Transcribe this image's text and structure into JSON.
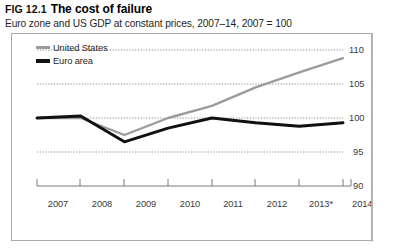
{
  "figure": {
    "number": "FIG 12.1",
    "title": "The cost of failure",
    "subtitle": "Euro zone and US GDP at constant prices, 2007–14, 2007 = 100"
  },
  "legend": {
    "position": "top-left",
    "items": [
      {
        "label": "United States",
        "color": "#9b9b9b",
        "swatch": "us"
      },
      {
        "label": "Euro area",
        "color": "#111111",
        "swatch": "ea"
      }
    ]
  },
  "axes": {
    "x_ticks": [
      "2007",
      "2008",
      "2009",
      "2010",
      "2011",
      "2012",
      "2013*",
      "2014*"
    ],
    "y_ticks": [
      "90",
      "95",
      "100",
      "105",
      "110"
    ],
    "y_tick_position": "right"
  },
  "chart_data": {
    "type": "line",
    "title": "The cost of failure",
    "subtitle": "Euro zone and US GDP at constant prices, 2007–14, 2007 = 100",
    "xlabel": "",
    "ylabel": "",
    "x": [
      "2007",
      "2008",
      "2009",
      "2010",
      "2011",
      "2012",
      "2013*",
      "2014*"
    ],
    "categories": [
      "2007",
      "2008",
      "2009",
      "2010",
      "2011",
      "2012",
      "2013*",
      "2014*"
    ],
    "series": [
      {
        "name": "United States",
        "color": "#9b9b9b",
        "values": [
          100.0,
          100.0,
          97.5,
          100.0,
          101.8,
          104.5,
          106.7,
          108.8
        ]
      },
      {
        "name": "Euro area",
        "color": "#111111",
        "values": [
          100.0,
          100.3,
          96.5,
          98.5,
          100.0,
          99.3,
          98.8,
          99.3
        ]
      }
    ],
    "ylim": [
      90,
      111.5
    ],
    "yticks": [
      90,
      95,
      100,
      105,
      110
    ],
    "grid": "horizontal-dotted",
    "legend_position": "top-left"
  }
}
